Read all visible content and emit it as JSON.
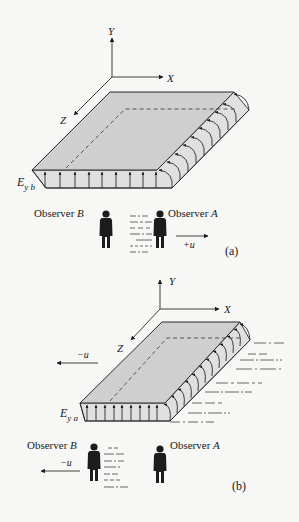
{
  "figure": {
    "panels": [
      {
        "id": "a",
        "caption": "(a)",
        "axes": {
          "y": "Y",
          "x": "X",
          "z": "Z"
        },
        "field_label": {
          "main": "E",
          "sub": "y b"
        },
        "observers": {
          "left": "Observer",
          "left_letter": "B",
          "right": "Observer",
          "right_letter": "A"
        },
        "velocity_label": "+u"
      },
      {
        "id": "b",
        "caption": "(b)",
        "axes": {
          "y": "Y",
          "x": "X",
          "z": "Z"
        },
        "field_label": {
          "main": "E",
          "sub": "y a"
        },
        "observers": {
          "left": "Observer",
          "left_letter": "B",
          "right": "Observer",
          "right_letter": "A"
        },
        "velocity_label_plate": "−u",
        "velocity_label_observer": "−u"
      }
    ],
    "colors": {
      "plate": "#cfcfcf",
      "line": "#2a2a2a",
      "background": "#f7f7f5"
    }
  }
}
